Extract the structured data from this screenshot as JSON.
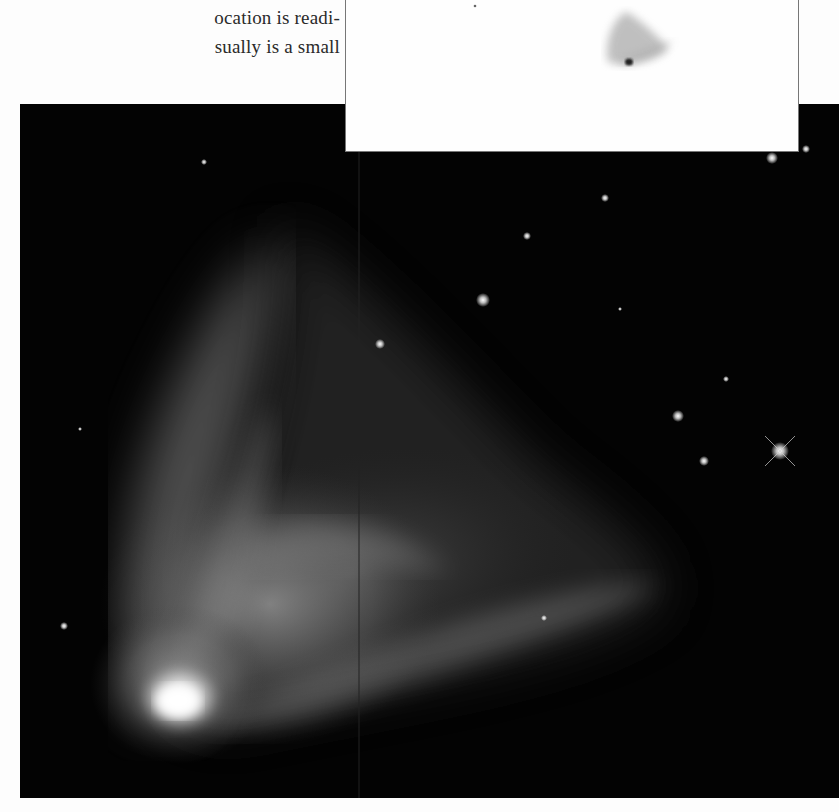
{
  "page": {
    "body_text": {
      "lines": [
        "ocation is readi-",
        "sually is a small"
      ]
    },
    "main_figure": {
      "subject": "bipolar reflection nebula with bright star-like core at lower left, fan-shaped gas cloud extending up and to the right",
      "style": "grayscale photograph on black background",
      "colors": {
        "background": "#030303",
        "nebula": "#bfbfbf",
        "core": "#ffffff"
      },
      "stars": [
        {
          "x": 463,
          "y": 196,
          "size": 4
        },
        {
          "x": 360,
          "y": 240,
          "size": 2.5
        },
        {
          "x": 507,
          "y": 132,
          "size": 2
        },
        {
          "x": 585,
          "y": 94,
          "size": 2
        },
        {
          "x": 658,
          "y": 312,
          "size": 3
        },
        {
          "x": 684,
          "y": 357,
          "size": 2.5
        },
        {
          "x": 760,
          "y": 347,
          "size": 4.5,
          "spikes": true
        },
        {
          "x": 752,
          "y": 54,
          "size": 3
        },
        {
          "x": 786,
          "y": 45,
          "size": 2
        },
        {
          "x": 706,
          "y": 275,
          "size": 1.5
        },
        {
          "x": 44,
          "y": 522,
          "size": 2
        },
        {
          "x": 524,
          "y": 514,
          "size": 2
        },
        {
          "x": 184,
          "y": 58,
          "size": 1.5
        }
      ]
    },
    "inset_figure": {
      "subject": "negative (inverted) image of the same nebula, dark on white",
      "colors": {
        "background": "#fefefe",
        "nebula": "#555555",
        "border": "#777777"
      },
      "stars": [
        {
          "x": 129,
          "y": 6,
          "size": 1.5
        }
      ]
    }
  }
}
